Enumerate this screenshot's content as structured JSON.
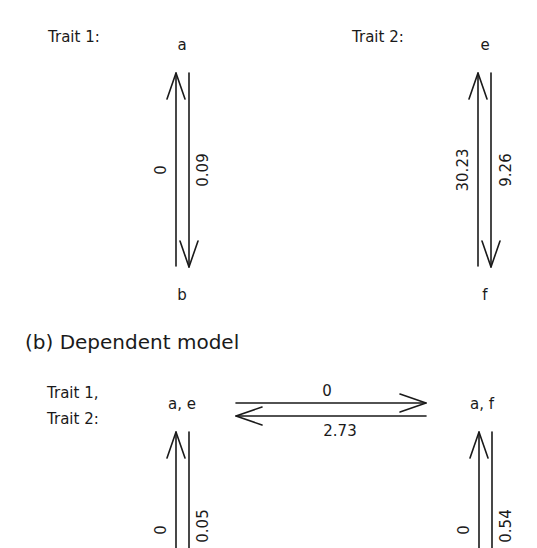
{
  "panel_a": {
    "trait1": {
      "label": "Trait 1:",
      "state_top": "a",
      "state_bottom": "b",
      "rate_up": "0",
      "rate_down": "0.09"
    },
    "trait2": {
      "label": "Trait 2:",
      "state_top": "e",
      "state_bottom": "f",
      "rate_up": "30.23",
      "rate_down": "9.26"
    }
  },
  "panel_b": {
    "title": "(b) Dependent model",
    "trait_label_line1": "Trait 1,",
    "trait_label_line2": "Trait 2:",
    "state_left": "a, e",
    "state_right": "a, f",
    "rate_right": "0",
    "rate_left": "2.73",
    "left_vertical": {
      "rate_up": "0",
      "rate_down": "0.05"
    },
    "right_vertical": {
      "rate_up": "0",
      "rate_down": "0.54"
    }
  },
  "colors": {
    "stroke": "#1a1a1a",
    "background": "#ffffff"
  }
}
